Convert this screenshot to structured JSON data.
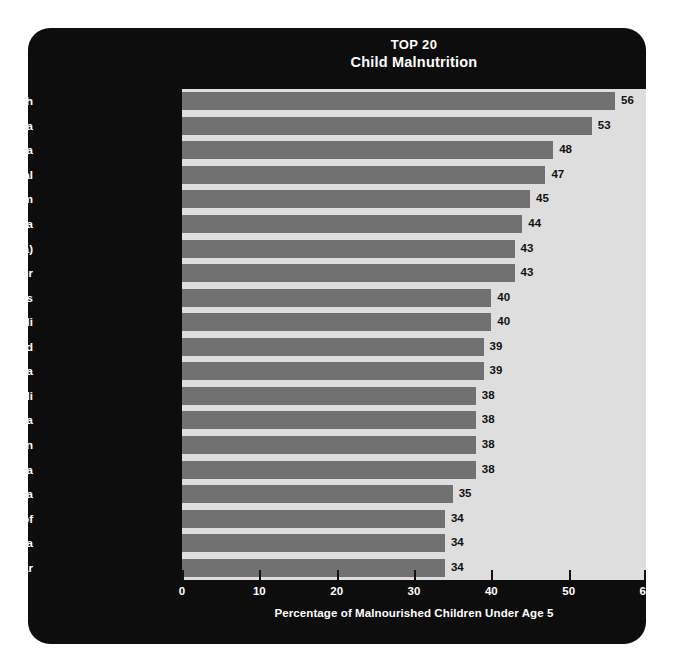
{
  "chart_data": {
    "type": "bar",
    "orientation": "horizontal",
    "title": "TOP 20",
    "subtitle": "Child Malnutrition",
    "xlabel": "Percentage of Malnourished Children Under Age 5",
    "ylabel": "",
    "xlim": [
      0,
      60
    ],
    "xticks": [
      0,
      10,
      20,
      30,
      40,
      50,
      60
    ],
    "xtick_labels": [
      "0",
      "10",
      "20",
      "30",
      "40",
      "50",
      "60"
    ],
    "grid": false,
    "legend": false,
    "bar_color": "#717171",
    "plot_background": "#dedede",
    "panel_background": "#0d0d0d",
    "label_color": "#ffffff",
    "value_label_color": "#111111",
    "categories": [
      "1. Bangladesh",
      "2. India",
      "3. Ethiopia",
      "4. Nepal",
      "5. Vietnam",
      "6. Eritrea",
      "7. Myanmar (Burma)",
      "8. Niger",
      "9. Laos",
      "10. Mali",
      "11. Chad",
      "12. Nigeria",
      "13. Burundi",
      "14. Cambodia",
      "15. Pakistan",
      "16. Sri Lanka",
      "17. Angola",
      "18. Congo, Dem. Rep. of",
      "19. Indonesia",
      "20. Madagascar"
    ],
    "values": [
      56,
      53,
      48,
      47,
      45,
      44,
      43,
      43,
      40,
      40,
      39,
      39,
      38,
      38,
      38,
      38,
      35,
      34,
      34,
      34
    ],
    "value_labels": [
      "56",
      "53",
      "48",
      "47",
      "45",
      "44",
      "43",
      "43",
      "40",
      "40",
      "39",
      "39",
      "38",
      "38",
      "38",
      "38",
      "35",
      "34",
      "34",
      "34"
    ]
  }
}
